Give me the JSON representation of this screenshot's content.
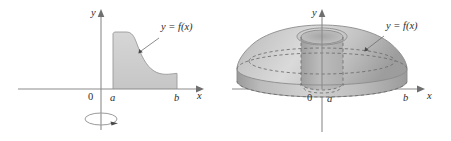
{
  "figure": {
    "background_color": "#ffffff",
    "panels": [
      {
        "id": "left-panel",
        "name": "plane-region-panel",
        "caption": "Region under the curve between x = a and x = b",
        "axes": {
          "x_label": "x",
          "y_label": "y",
          "origin_label": "0",
          "tick_labels": [
            "a",
            "b"
          ]
        },
        "curve_label": "y = f(x)",
        "rotation_indicator": {
          "name": "rotation-arrow",
          "about": "y-axis",
          "description": "ellipse with arrowhead indicating revolution about the y-axis"
        },
        "region_fill_color": "#cfcfcf",
        "region_stroke_color": "#9a9a9a"
      },
      {
        "id": "right-panel",
        "name": "solid-of-revolution-panel",
        "caption": "Resulting solid with cylindrical hole of radius a",
        "axes": {
          "x_label": "x",
          "y_label": "y",
          "origin_label": "0",
          "tick_labels": [
            "a",
            "b"
          ]
        },
        "curve_label": "y = f(x)",
        "solid_light_color": "#d6d6d6",
        "solid_mid_color": "#b4b4b4",
        "solid_dark_color": "#9c9c9c",
        "hidden_line_color": "#6d6d6d"
      }
    ],
    "colors": {
      "axis": "#8c8c8c",
      "label_text": "#2b2b2b",
      "leader": "#6f6f6f",
      "fill_light": "#d8d8d8",
      "fill_mid": "#bdbdbd",
      "fill_dark": "#a0a0a0"
    }
  }
}
